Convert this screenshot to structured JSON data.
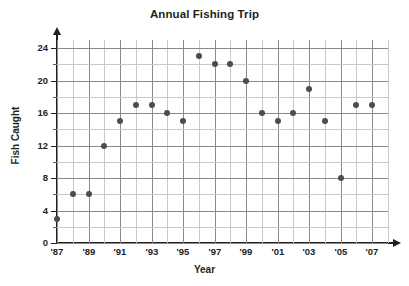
{
  "chart_data": {
    "type": "scatter",
    "title": "Annual Fishing Trip",
    "xlabel": "Year",
    "ylabel": "Fish Caught",
    "grid": true,
    "legend": null,
    "xlim": [
      1987,
      2008
    ],
    "ylim": [
      0,
      25
    ],
    "x_tick_labels": [
      "'87",
      "'89",
      "'91",
      "'93",
      "'95",
      "'97",
      "'99",
      "'01",
      "'03",
      "'05",
      "'07"
    ],
    "x_tick_values": [
      1987,
      1989,
      1991,
      1993,
      1995,
      1997,
      1999,
      2001,
      2003,
      2005,
      2007
    ],
    "y_tick_labels": [
      "0",
      "4",
      "8",
      "12",
      "16",
      "20",
      "24"
    ],
    "y_tick_values": [
      0,
      4,
      8,
      12,
      16,
      20,
      24
    ],
    "y_minor_step": 2,
    "x_minor_step": 1,
    "x": [
      1987,
      1988,
      1989,
      1990,
      1991,
      1992,
      1993,
      1994,
      1995,
      1996,
      1997,
      1998,
      1999,
      2000,
      2001,
      2002,
      2003,
      2004,
      2005,
      2006,
      2007
    ],
    "values": [
      3,
      6,
      6,
      12,
      15,
      17,
      17,
      16,
      15,
      23,
      22,
      22,
      20,
      16,
      15,
      16,
      19,
      15,
      8,
      17,
      17
    ],
    "points": [
      {
        "year": "'87",
        "x": 1987,
        "y": 3
      },
      {
        "year": "'88",
        "x": 1988,
        "y": 6
      },
      {
        "year": "'89",
        "x": 1989,
        "y": 6
      },
      {
        "year": "'90",
        "x": 1990,
        "y": 12
      },
      {
        "year": "'91",
        "x": 1991,
        "y": 15
      },
      {
        "year": "'92",
        "x": 1992,
        "y": 17
      },
      {
        "year": "'93",
        "x": 1993,
        "y": 17
      },
      {
        "year": "'94",
        "x": 1994,
        "y": 16
      },
      {
        "year": "'95",
        "x": 1995,
        "y": 15
      },
      {
        "year": "'96",
        "x": 1996,
        "y": 23
      },
      {
        "year": "'97",
        "x": 1997,
        "y": 22
      },
      {
        "year": "'98",
        "x": 1998,
        "y": 22
      },
      {
        "year": "'99",
        "x": 1999,
        "y": 20
      },
      {
        "year": "'00",
        "x": 2000,
        "y": 16
      },
      {
        "year": "'01",
        "x": 2001,
        "y": 15
      },
      {
        "year": "'02",
        "x": 2002,
        "y": 16
      },
      {
        "year": "'03",
        "x": 2003,
        "y": 19
      },
      {
        "year": "'04",
        "x": 2004,
        "y": 15
      },
      {
        "year": "'05",
        "x": 2005,
        "y": 8
      },
      {
        "year": "'06",
        "x": 2006,
        "y": 17
      },
      {
        "year": "'07",
        "x": 2007,
        "y": 17
      }
    ],
    "colors": {
      "marker": "#4d4d4f",
      "axis": "#231f20",
      "grid_major": "#8a8a8a",
      "grid_minor": "#c9c9c9",
      "text": "#231f20",
      "background": "#ffffff"
    }
  }
}
